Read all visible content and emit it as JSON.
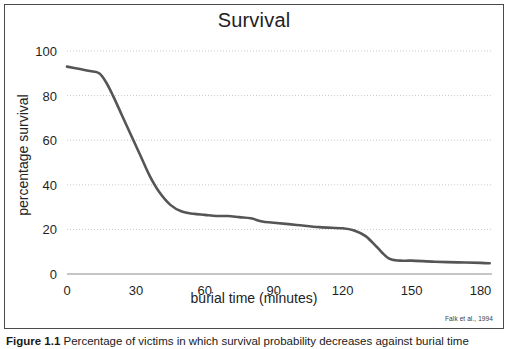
{
  "figure": {
    "caption_label": "Figure 1.1",
    "caption_text": "Percentage of victims in which survival probability decreases against burial time"
  },
  "credit": "Falk et al., 1994",
  "chart_data": {
    "type": "line",
    "title": "Survival",
    "xlabel": "burial time (minutes)",
    "ylabel": "percentage survival",
    "xlim": [
      0,
      185
    ],
    "ylim": [
      0,
      100
    ],
    "xticks": [
      0,
      30,
      60,
      90,
      120,
      150,
      180
    ],
    "xtick_labels": [
      "0",
      "30",
      "60",
      "90",
      "120",
      "150",
      "180"
    ],
    "yticks": [
      0,
      20,
      40,
      60,
      80,
      100
    ],
    "ytick_labels": [
      "0",
      "20",
      "40",
      "60",
      "80",
      "100"
    ],
    "grid": "horizontal-dotted",
    "legend": "none",
    "line_color": "#555555",
    "series": [
      {
        "name": "percentage survival",
        "x": [
          0,
          5,
          10,
          14,
          17,
          20,
          24,
          28,
          32,
          36,
          40,
          45,
          50,
          55,
          60,
          65,
          70,
          75,
          80,
          85,
          90,
          100,
          110,
          120,
          125,
          130,
          135,
          140,
          145,
          150,
          160,
          170,
          180,
          184
        ],
        "y": [
          93,
          92,
          91,
          90,
          86,
          80,
          71,
          62,
          53,
          44,
          37,
          31,
          28,
          27,
          26.5,
          26,
          26,
          25.5,
          25,
          23.5,
          23,
          22,
          21,
          20.5,
          19.5,
          17,
          12,
          7,
          6,
          6,
          5.5,
          5.2,
          5,
          4.8
        ]
      }
    ]
  }
}
